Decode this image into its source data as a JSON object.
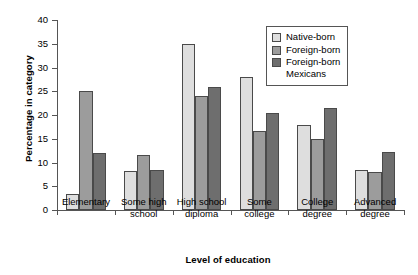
{
  "chart_data": {
    "type": "bar",
    "title": "",
    "xlabel": "Level of education",
    "ylabel": "Percentage in category",
    "ylim": [
      0,
      40
    ],
    "yticks": [
      0,
      5,
      10,
      15,
      20,
      25,
      30,
      35,
      40
    ],
    "grid": false,
    "legend_position": "top-right",
    "categories": [
      "Elementary",
      "Some high\nschool",
      "High school\ndiploma",
      "Some\ncollege",
      "College\ndegree",
      "Advanced\ndegree"
    ],
    "series": [
      {
        "name": "Native-born",
        "color": "#dedede",
        "values": [
          3.3,
          8.3,
          35.0,
          28.0,
          18.0,
          8.5
        ]
      },
      {
        "name": "Foreign-born",
        "color": "#9c9c9c",
        "values": [
          25.0,
          11.5,
          24.0,
          16.6,
          15.0,
          8.0
        ]
      },
      {
        "name": "Foreign-born\nMexicans",
        "color": "#6e6e6e",
        "values": [
          12.0,
          8.4,
          25.8,
          20.5,
          21.5,
          12.2
        ]
      }
    ]
  }
}
